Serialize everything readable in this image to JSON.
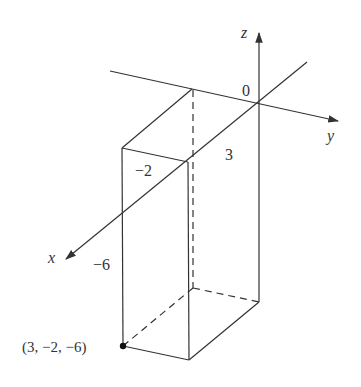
{
  "diagram": {
    "type": "3d-coordinate-box",
    "colors": {
      "line": "#333333",
      "background": "#ffffff",
      "point": "#111111"
    },
    "axes": {
      "x": {
        "label": "x"
      },
      "y": {
        "label": "y"
      },
      "z": {
        "label": "z"
      }
    },
    "origin_label": "0",
    "dimension_labels": {
      "x_length": "3",
      "y_length": "−2",
      "z_length": "−6"
    },
    "point": {
      "label": "(3, −2, −6)",
      "coords": [
        3,
        -2,
        -6
      ]
    }
  }
}
